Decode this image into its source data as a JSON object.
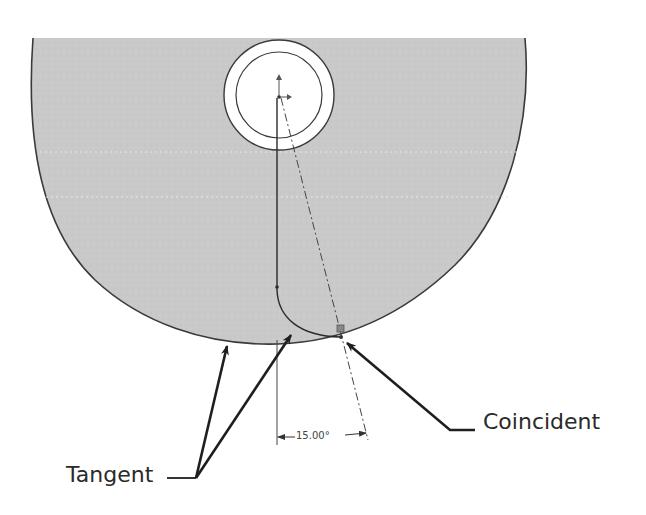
{
  "diagram": {
    "type": "cad-sketch",
    "dimension": {
      "value": "15.00°"
    },
    "callouts": {
      "coincident": "Coincident",
      "tangent": "Tangent"
    },
    "colors": {
      "part_fill": "#c8c8c8",
      "outline": "#3a3a3a",
      "background": "#ffffff",
      "text": "#2a2a2a"
    }
  }
}
